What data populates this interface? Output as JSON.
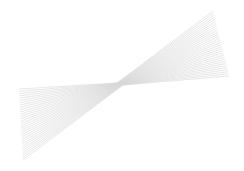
{
  "figure": {
    "width": 244,
    "height": 171,
    "background": "#ffffff",
    "line_color": "#d6d6d6",
    "line_width": 0.6,
    "line_count": 32,
    "center": [
      120,
      84
    ],
    "left_ends": {
      "start": [
        19,
        89
      ],
      "end": [
        23,
        160
      ]
    },
    "right_ends": {
      "start": [
        213,
        11
      ],
      "end": [
        229,
        76
      ]
    }
  }
}
